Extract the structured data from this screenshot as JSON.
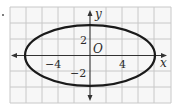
{
  "figure": {
    "type": "ellipse-graph",
    "equation": "x^2/64 + y^2/16 = 1",
    "center": [
      0,
      0
    ],
    "semi_major_axis": 8,
    "semi_minor_axis": 4,
    "grid_units_per_cell": 2
  },
  "axes": {
    "x_label": "x",
    "y_label": "y",
    "origin_label": "O"
  },
  "tick_labels": {
    "x_neg": "−4",
    "x_pos": "4",
    "y_pos": "2",
    "y_neg": "−2"
  },
  "colors": {
    "grid": "#c8c8c8",
    "axis": "#333333",
    "curve": "#1a1a1a",
    "background": "#ffffff"
  },
  "marker": "."
}
